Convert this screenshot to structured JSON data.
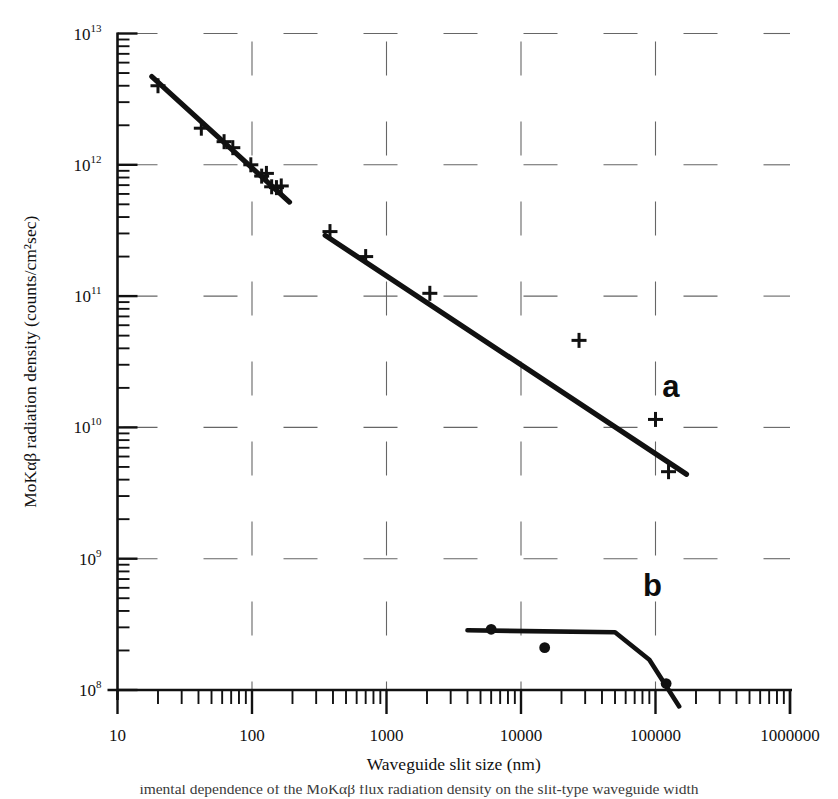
{
  "figure": {
    "y_axis_title": "MoKαβ radiation density (counts/cm²sec)",
    "x_axis_title": "Waveguide slit size (nm)",
    "caption_partial": "imental dependence of the MoKαβ flux radiation density on the slit-type waveguide width",
    "curve_a_label": "a",
    "curve_b_label": "b",
    "line_color": "#111111",
    "grid_color": "#666666",
    "axis_color": "#111111"
  },
  "axes": {
    "x_ticks": [
      "10",
      "100",
      "1000",
      "10000",
      "100000",
      "1000000"
    ],
    "y_ticks": [
      {
        "mantissa": "10",
        "exponent": "13"
      },
      {
        "mantissa": "10",
        "exponent": "12"
      },
      {
        "mantissa": "10",
        "exponent": "11"
      },
      {
        "mantissa": "10",
        "exponent": "10"
      },
      {
        "mantissa": "10",
        "exponent": "9"
      },
      {
        "mantissa": "10",
        "exponent": "8"
      }
    ]
  },
  "chart_data": {
    "type": "scatter",
    "title": "",
    "xlabel": "Waveguide slit size (nm)",
    "ylabel": "MoKαβ radiation density (counts/cm²sec)",
    "xscale": "log",
    "yscale": "log",
    "xlim": [
      10,
      1000000
    ],
    "ylim": [
      100000000,
      10000000000000
    ],
    "grid": true,
    "legend": "inline-labels",
    "series": [
      {
        "name": "a",
        "marker": "plus",
        "label_position": {
          "x": 130000,
          "y": 17000000000
        },
        "x": [
          20,
          42,
          62,
          72,
          98,
          118,
          128,
          140,
          152,
          165,
          380,
          700,
          2100,
          27000,
          100000,
          125000
        ],
        "y": [
          4000000000000.0,
          1900000000000.0,
          1500000000000.0,
          1350000000000.0,
          1000000000000.0,
          820000000000.0,
          860000000000.0,
          680000000000.0,
          670000000000.0,
          690000000000.0,
          310000000000.0,
          200000000000.0,
          105000000000.0,
          46000000000.0,
          11500000000.0,
          4600000000.0
        ],
        "fit_segments": [
          {
            "x": [
              18,
              190
            ],
            "y": [
              4700000000000.0,
              520000000000.0
            ]
          },
          {
            "x": [
              350,
              170000
            ],
            "y": [
              290000000000.0,
              4400000000.0
            ]
          }
        ]
      },
      {
        "name": "b",
        "marker": "circle",
        "label_position": {
          "x": 95000,
          "y": 520000000.0
        },
        "x": [
          6000,
          15000,
          120000
        ],
        "y": [
          290000000.0,
          210000000.0,
          112000000.0
        ],
        "fit_segments": [
          {
            "x": [
              4000,
              50000,
              90000,
              150000
            ],
            "y": [
              285000000.0,
              275000000.0,
              170000000.0,
              75000000.0
            ]
          }
        ]
      }
    ]
  }
}
